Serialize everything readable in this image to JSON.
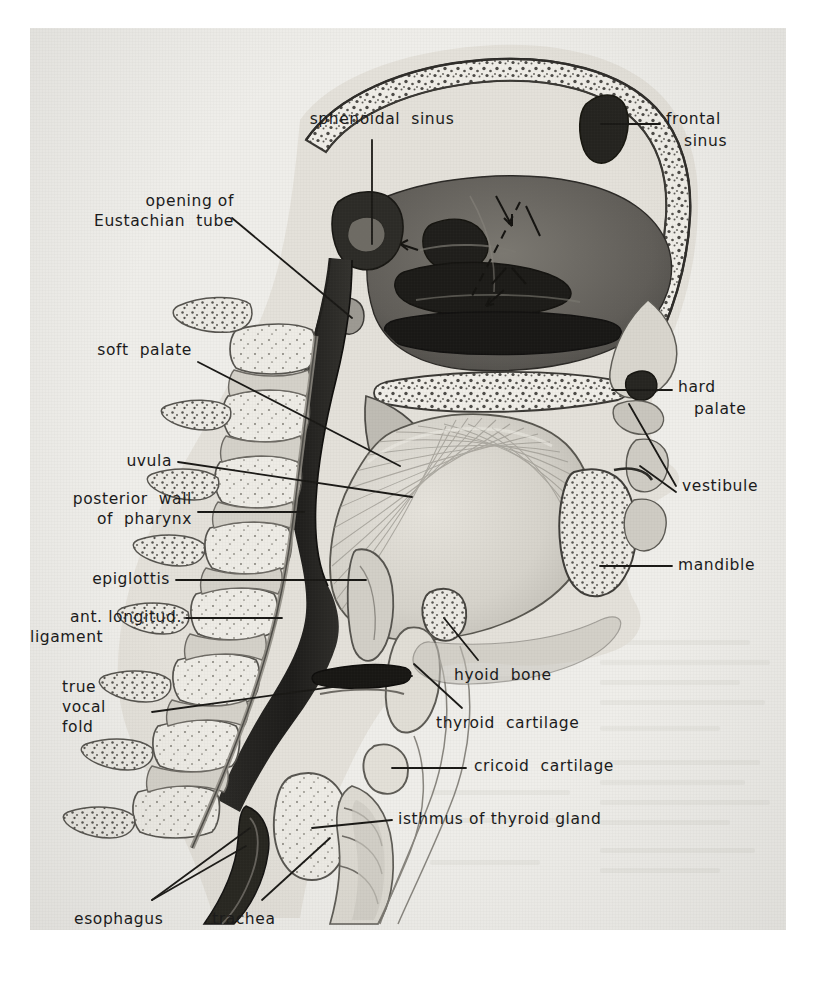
{
  "figure": {
    "view": "midsagittal (median) section, facing right",
    "style": "halftone pen-and-ink anatomical illustration on aged paper",
    "background_color": "#f3f2ee",
    "ink_color": "#1b1b1b",
    "label_count": 17
  },
  "labels": {
    "sphenoidal_sinus": "sphenoidal  sinus",
    "frontal_sinus_l1": "frontal",
    "frontal_sinus_l2": "sinus",
    "eustachian_l1": "opening of",
    "eustachian_l2": "Eustachian  tube",
    "soft_palate": "soft  palate",
    "hard_palate_l1": "hard",
    "hard_palate_l2": "palate",
    "uvula": "uvula",
    "vestibule": "vestibule",
    "posterior_wall_l1": "posterior  wall",
    "posterior_wall_l2": "of  pharynx",
    "mandible": "mandible",
    "epiglottis": "epiglottis",
    "ant_ligament_l1": "ant. longitud.",
    "ant_ligament_l2": "ligament",
    "hyoid_bone": "hyoid  bone",
    "true_vocal_fold_l1": "true",
    "true_vocal_fold_l2": "vocal",
    "true_vocal_fold_l3": "fold",
    "thyroid_cartilage": "thyroid  cartilage",
    "cricoid_cartilage": "cricoid  cartilage",
    "isthmus_thyroid": "isthmus of thyroid gland",
    "esophagus": "esophagus",
    "trachea": "trachea"
  },
  "structures": [
    {
      "name": "sphenoidal sinus",
      "side": "left-top",
      "label_key": "sphenoidal_sinus"
    },
    {
      "name": "frontal sinus",
      "side": "right-top",
      "label_key": "frontal_sinus_l1"
    },
    {
      "name": "opening of Eustachian tube",
      "side": "left",
      "label_key": "eustachian_l1"
    },
    {
      "name": "soft palate",
      "side": "left",
      "label_key": "soft_palate"
    },
    {
      "name": "hard palate",
      "side": "right",
      "label_key": "hard_palate_l1"
    },
    {
      "name": "uvula",
      "side": "left",
      "label_key": "uvula"
    },
    {
      "name": "vestibule",
      "side": "right",
      "label_key": "vestibule"
    },
    {
      "name": "posterior wall of pharynx",
      "side": "left",
      "label_key": "posterior_wall_l1"
    },
    {
      "name": "mandible",
      "side": "right",
      "label_key": "mandible"
    },
    {
      "name": "epiglottis",
      "side": "left",
      "label_key": "epiglottis"
    },
    {
      "name": "ant. longitud. ligament",
      "side": "left",
      "label_key": "ant_ligament_l1"
    },
    {
      "name": "hyoid bone",
      "side": "center",
      "label_key": "hyoid_bone"
    },
    {
      "name": "true vocal fold",
      "side": "left",
      "label_key": "true_vocal_fold_l1"
    },
    {
      "name": "thyroid cartilage",
      "side": "center-right",
      "label_key": "thyroid_cartilage"
    },
    {
      "name": "cricoid cartilage",
      "side": "center-right",
      "label_key": "cricoid_cartilage"
    },
    {
      "name": "isthmus of thyroid gland",
      "side": "center-right",
      "label_key": "isthmus_thyroid"
    },
    {
      "name": "esophagus",
      "side": "bottom-left",
      "label_key": "esophagus"
    },
    {
      "name": "trachea",
      "side": "bottom-center",
      "label_key": "trachea"
    }
  ]
}
